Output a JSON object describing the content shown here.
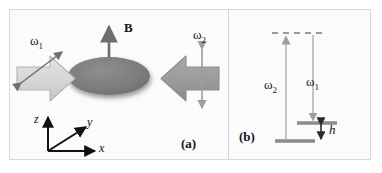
{
  "figure": {
    "panels": [
      {
        "tag": "(a)",
        "tag_name": "panel-label-a",
        "field_label": "B",
        "field_icon": "up-arrow-icon",
        "disk_icon": "gray-ellipse-disk",
        "left_arrow": {
          "icon": "right-pointing-block-arrow",
          "color": "#d4d4d4",
          "oscillation_label": "ω",
          "oscillation_sub": "1",
          "oscillation_icon": "diagonal-double-headed-arrow"
        },
        "right_arrow": {
          "icon": "left-pointing-block-arrow",
          "color": "#9b9b9b",
          "oscillation_label": "ω",
          "oscillation_sub": "2",
          "oscillation_icon": "vertical-double-headed-arrow"
        },
        "axes": {
          "icon": "coordinate-axes-triad",
          "z": "z",
          "y": "y",
          "x": "x"
        }
      },
      {
        "tag": "(b)",
        "tag_name": "panel-label-b",
        "virtual_level_icon": "dashed-level-line",
        "upper_level_icon": "solid-level-line",
        "lower_level_icon": "solid-level-line",
        "transition_up": {
          "label": "ω",
          "sub": "2",
          "icon": "up-arrow-icon"
        },
        "transition_down": {
          "label": "ω",
          "sub": "1",
          "icon": "down-arrow-icon"
        },
        "splitting": {
          "label": "h",
          "icon": "vertical-double-headed-arrow"
        }
      }
    ],
    "colors": {
      "frame_border": "#d9d9d9",
      "background": "#fbfbfb",
      "disk": "#808080",
      "level_line": "#8c8c8c",
      "arrow_stroke": "#9a9a9a",
      "axis": "#111111",
      "text": "#1a1a1a"
    }
  }
}
